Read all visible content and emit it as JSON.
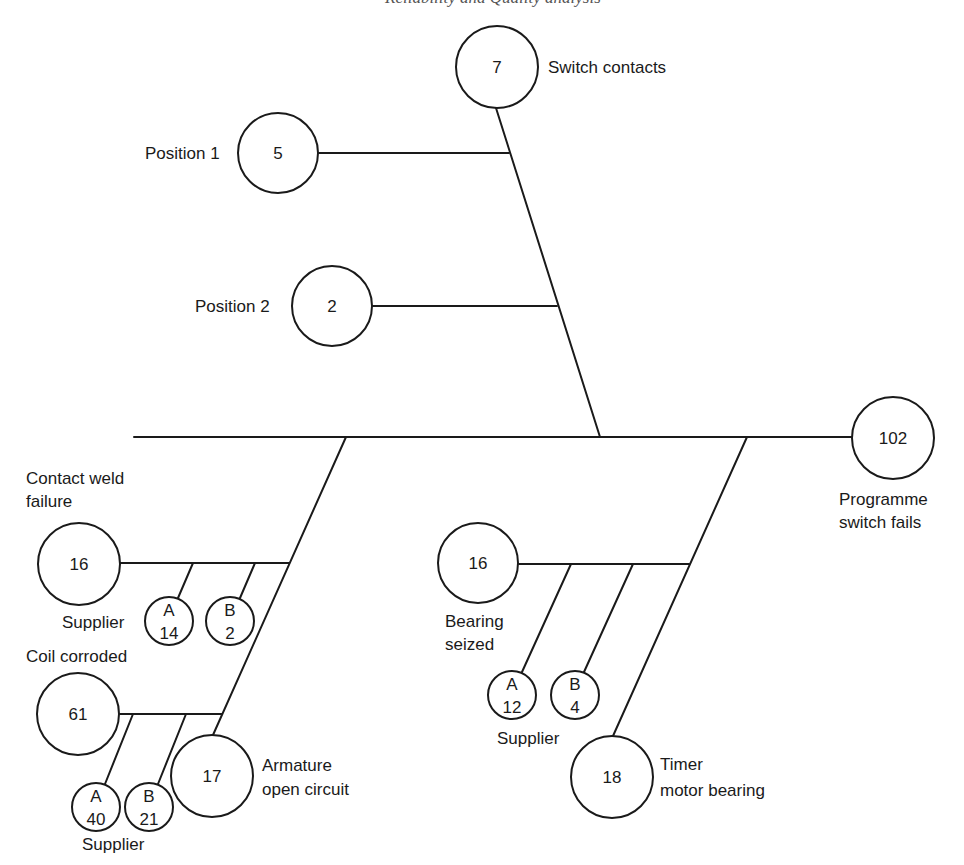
{
  "header": {
    "page_number": "",
    "running_title": "Reliability and Quality analysis"
  },
  "diagram": {
    "type": "fishbone / failure tree",
    "root": {
      "value": "102",
      "label_line1": "Programme",
      "label_line2": "switch fails"
    },
    "switch_contacts": {
      "value": "7",
      "label": "Switch contacts",
      "children": [
        {
          "value": "5",
          "label": "Position 1"
        },
        {
          "value": "2",
          "label": "Position 2"
        }
      ]
    },
    "contact_weld": {
      "value": "16",
      "label_line1": "Contact weld",
      "label_line2": "failure",
      "supplier_label": "Supplier",
      "suppliers": [
        {
          "id": "A",
          "value": "14"
        },
        {
          "id": "B",
          "value": "2"
        }
      ]
    },
    "coil_corroded": {
      "value": "61",
      "label": "Coil corroded",
      "supplier_label": "Supplier",
      "suppliers": [
        {
          "id": "A",
          "value": "40"
        },
        {
          "id": "B",
          "value": "21"
        }
      ]
    },
    "armature": {
      "value": "17",
      "label_line1": "Armature",
      "label_line2": "open circuit"
    },
    "bearing_seized": {
      "value": "16",
      "label_line1": "Bearing",
      "label_line2": "seized",
      "supplier_label": "Supplier",
      "suppliers": [
        {
          "id": "A",
          "value": "12"
        },
        {
          "id": "B",
          "value": "4"
        }
      ]
    },
    "timer_motor": {
      "value": "18",
      "label_line1": "Timer",
      "label_line2": "motor bearing"
    }
  }
}
